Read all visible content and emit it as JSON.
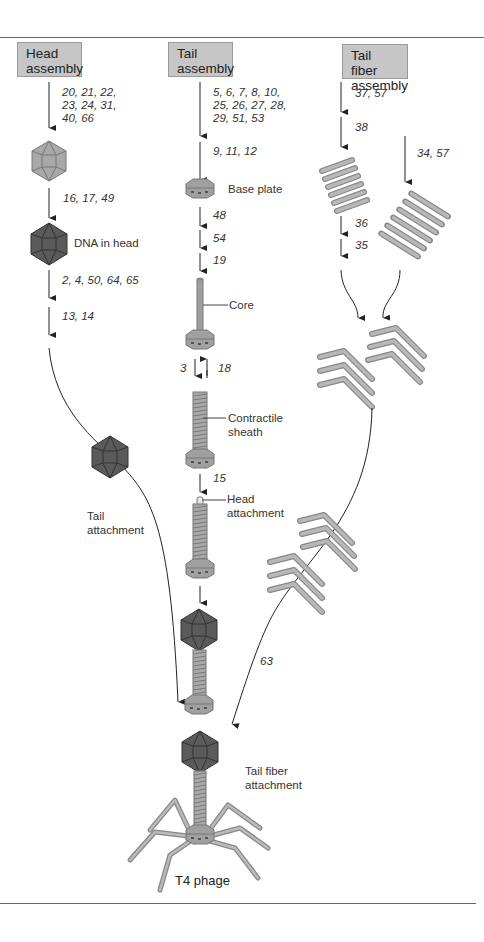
{
  "figure": {
    "title": "T4 phage",
    "columns": [
      {
        "id": "head",
        "header": [
          "Head",
          "assembly"
        ]
      },
      {
        "id": "tail",
        "header": [
          "Tail",
          "assembly"
        ]
      },
      {
        "id": "fiber",
        "header": [
          "Tail fiber",
          "assembly"
        ]
      }
    ],
    "head_steps": {
      "genes_1": [
        "20, 21, 22,",
        "23, 24, 31,",
        "40, 66"
      ],
      "genes_2": "16, 17, 49",
      "dna_label": "DNA in head",
      "genes_3": "2, 4, 50, 64, 65",
      "genes_4": "13, 14"
    },
    "tail_steps": {
      "genes_1": [
        "5, 6, 7, 8, 10,",
        "25, 26, 27, 28,",
        "29, 51, 53"
      ],
      "genes_2": "9, 11, 12",
      "base_plate_label": "Base plate",
      "genes_3": "48",
      "genes_4": "54",
      "genes_5": "19",
      "core_label": "Core",
      "genes_6a": "3",
      "genes_6b": "18",
      "sheath_label": [
        "Contractile",
        "sheath"
      ],
      "genes_7": "15",
      "head_attach_label": [
        "Head",
        "attachment"
      ]
    },
    "fiber_steps": {
      "genes_1": "37, 57",
      "genes_2": "38",
      "genes_3": "34, 57",
      "genes_4": "36",
      "genes_5": "35",
      "genes_6": "63"
    },
    "tail_attachment_label": [
      "Tail",
      "attachment"
    ],
    "tail_fiber_attachment_label": [
      "Tail fiber",
      "attachment"
    ],
    "colors": {
      "box_fill": "#c6c6c6",
      "empty_head": "#a8a8a8",
      "dna_head": "#5a5a5a",
      "tail_gray": "#a0a0a0",
      "arrow": "#222222"
    }
  }
}
